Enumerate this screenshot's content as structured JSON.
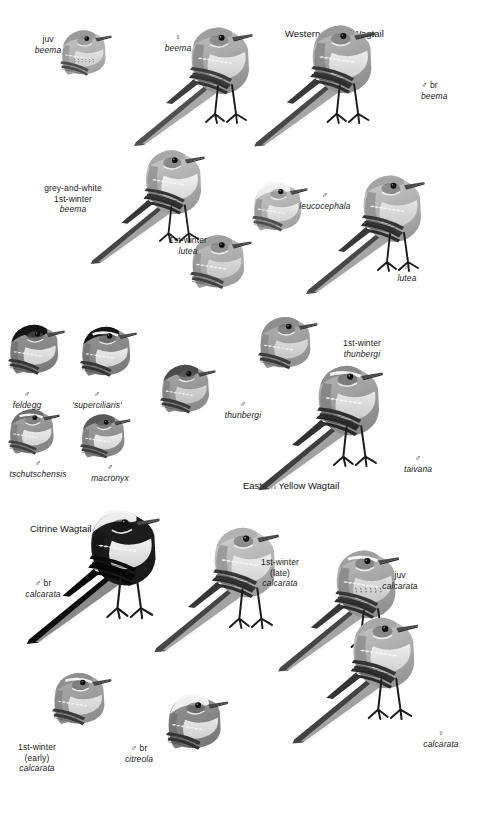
{
  "plate": {
    "kind": "bird-identification-plate",
    "background": "#ffffff",
    "ink": "#1a1a1a",
    "titles": [
      {
        "id": "western-yellow-wagtail",
        "text": "Western Yellow Wagtail",
        "x": 285,
        "y": 28
      },
      {
        "id": "eastern-yellow-wagtail",
        "text": "Eastern Yellow Wagtail",
        "x": 243,
        "y": 480
      },
      {
        "id": "citrine-wagtail",
        "text": "Citrine Wagtail",
        "x": 30,
        "y": 523
      }
    ],
    "labels": [
      {
        "id": "juv-beema",
        "align": "center",
        "x": 48,
        "y": 34,
        "lines": [
          {
            "text": "juv",
            "style": "roman"
          },
          {
            "text": "beema",
            "style": "italic"
          }
        ]
      },
      {
        "id": "female-beema",
        "align": "center",
        "x": 178,
        "y": 32,
        "lines": [
          {
            "text": "♀",
            "style": "symbol"
          },
          {
            "text": "beema",
            "style": "italic"
          }
        ]
      },
      {
        "id": "male-br-beema",
        "align": "left",
        "x": 421,
        "y": 80,
        "lines": [
          {
            "text": "♂ br",
            "style": "symbol"
          },
          {
            "text": "beema",
            "style": "italic"
          }
        ]
      },
      {
        "id": "grey-and-white-1st-winter-beema",
        "align": "center",
        "x": 73,
        "y": 183,
        "lines": [
          {
            "text": "grey-and-white",
            "style": "roman"
          },
          {
            "text": "1st-winter",
            "style": "roman"
          },
          {
            "text": "beema",
            "style": "italic"
          }
        ]
      },
      {
        "id": "male-leucocephala",
        "align": "center",
        "x": 325,
        "y": 190,
        "lines": [
          {
            "text": "♂",
            "style": "symbol"
          },
          {
            "text": "leucocephala",
            "style": "italic"
          }
        ]
      },
      {
        "id": "1st-winter-lutea",
        "align": "center",
        "x": 188,
        "y": 235,
        "lines": [
          {
            "text": "1st-winter",
            "style": "roman"
          },
          {
            "text": "lutea",
            "style": "italic"
          }
        ]
      },
      {
        "id": "male-lutea",
        "align": "center",
        "x": 407,
        "y": 262,
        "lines": [
          {
            "text": "♂",
            "style": "symbol"
          },
          {
            "text": "lutea",
            "style": "italic"
          }
        ]
      },
      {
        "id": "1st-winter-thunbergi",
        "align": "center",
        "x": 362,
        "y": 338,
        "lines": [
          {
            "text": "1st-winter",
            "style": "roman"
          },
          {
            "text": "thunbergi",
            "style": "italic"
          }
        ]
      },
      {
        "id": "male-feldegg",
        "align": "center",
        "x": 27,
        "y": 389,
        "lines": [
          {
            "text": "♂",
            "style": "symbol"
          },
          {
            "text": "feldegg",
            "style": "italic"
          }
        ]
      },
      {
        "id": "male-superciliaris",
        "align": "center",
        "x": 97,
        "y": 389,
        "lines": [
          {
            "text": "♂",
            "style": "symbol"
          },
          {
            "text": "'superciliaris'",
            "style": "italic"
          }
        ]
      },
      {
        "id": "male-thunbergi",
        "align": "center",
        "x": 243,
        "y": 399,
        "lines": [
          {
            "text": "♂",
            "style": "symbol"
          },
          {
            "text": "thunbergi",
            "style": "italic"
          }
        ]
      },
      {
        "id": "male-tschutschensis",
        "align": "center",
        "x": 38,
        "y": 458,
        "lines": [
          {
            "text": "♂",
            "style": "symbol"
          },
          {
            "text": "tschutschensis",
            "style": "italic"
          }
        ]
      },
      {
        "id": "male-macronyx",
        "align": "center",
        "x": 110,
        "y": 462,
        "lines": [
          {
            "text": "♂",
            "style": "symbol"
          },
          {
            "text": "macronyx",
            "style": "italic"
          }
        ]
      },
      {
        "id": "male-taivana",
        "align": "center",
        "x": 418,
        "y": 453,
        "lines": [
          {
            "text": "♂",
            "style": "symbol"
          },
          {
            "text": "taivana",
            "style": "italic"
          }
        ]
      },
      {
        "id": "male-br-calcarata",
        "align": "center",
        "x": 43,
        "y": 578,
        "lines": [
          {
            "text": "♂ br",
            "style": "symbol"
          },
          {
            "text": "calcarata",
            "style": "italic"
          }
        ]
      },
      {
        "id": "1st-winter-late-calcarata",
        "align": "center",
        "x": 280,
        "y": 557,
        "lines": [
          {
            "text": "1st-winter",
            "style": "roman"
          },
          {
            "text": "(late)",
            "style": "roman"
          },
          {
            "text": "calcarata",
            "style": "italic"
          }
        ]
      },
      {
        "id": "juv-calcarata",
        "align": "center",
        "x": 400,
        "y": 570,
        "lines": [
          {
            "text": "juv",
            "style": "roman"
          },
          {
            "text": "calcarata",
            "style": "italic"
          }
        ]
      },
      {
        "id": "1st-winter-early-calcarata",
        "align": "center",
        "x": 37,
        "y": 742,
        "lines": [
          {
            "text": "1st-winter",
            "style": "roman"
          },
          {
            "text": "(early)",
            "style": "roman"
          },
          {
            "text": "calcarata",
            "style": "italic"
          }
        ]
      },
      {
        "id": "male-br-citreola",
        "align": "center",
        "x": 139,
        "y": 743,
        "lines": [
          {
            "text": "♂ br",
            "style": "symbol"
          },
          {
            "text": "citreola",
            "style": "italic"
          }
        ]
      },
      {
        "id": "female-calcarata",
        "align": "center",
        "x": 441,
        "y": 728,
        "lines": [
          {
            "text": "♀",
            "style": "symbol"
          },
          {
            "text": "calcarata",
            "style": "italic"
          }
        ]
      }
    ],
    "birds": [
      {
        "id": "bird-juv-beema",
        "species": "juv beema",
        "form": "head-bust",
        "x": 60,
        "y": 26,
        "scale": 0.8,
        "flip": false,
        "crown": "#9a9a9a",
        "body": "#bdbdbd",
        "under": "#e6e6e6",
        "wing": "#8a8a8a",
        "cap": "none",
        "streaked": true
      },
      {
        "id": "bird-female-beema",
        "species": "female beema",
        "form": "full-body",
        "x": 128,
        "y": 22,
        "scale": 1.0,
        "flip": false,
        "crown": "#9d9d9d",
        "body": "#b2b2b2",
        "under": "#e9e9e9",
        "wing": "#7a7a7a",
        "cap": "grey",
        "streaked": false
      },
      {
        "id": "bird-male-br-beema",
        "species": "male breeding beema",
        "form": "full-body",
        "x": 248,
        "y": 20,
        "scale": 1.02,
        "flip": false,
        "crown": "#9a9a9a",
        "body": "#aeaeae",
        "under": "#ececec",
        "wing": "#6f6f6f",
        "cap": "grey",
        "streaked": false
      },
      {
        "id": "bird-grey-and-white-beema",
        "species": "grey-and-white 1st-winter beema",
        "form": "full-body",
        "x": 85,
        "y": 145,
        "scale": 0.96,
        "flip": false,
        "crown": "#a8a8a8",
        "body": "#bcbcbc",
        "under": "#f2f2f2",
        "wing": "#6a6a6a",
        "cap": "grey",
        "streaked": false
      },
      {
        "id": "bird-male-leucocephala",
        "species": "male leucocephala",
        "form": "head-bust",
        "x": 252,
        "y": 178,
        "scale": 0.86,
        "flip": false,
        "crown": "#efefef",
        "body": "#bdbdbd",
        "under": "#ededed",
        "wing": "#8f8f8f",
        "cap": "white",
        "streaked": false
      },
      {
        "id": "bird-male-lutea",
        "species": "male lutea",
        "form": "full-body",
        "x": 300,
        "y": 170,
        "scale": 1.0,
        "flip": false,
        "crown": "#a5a5a5",
        "body": "#bdbdbd",
        "under": "#e4e4e4",
        "wing": "#6e6e6e",
        "cap": "grey",
        "streaked": false
      },
      {
        "id": "bird-1st-winter-lutea",
        "species": "1st-winter lutea",
        "form": "head-bust",
        "x": 190,
        "y": 230,
        "scale": 0.95,
        "flip": false,
        "crown": "#9f9f9f",
        "body": "#b6b6b6",
        "under": "#dcdcdc",
        "wing": "#7d7d7d",
        "cap": "grey",
        "streaked": false
      },
      {
        "id": "bird-1st-winter-thunbergi",
        "species": "1st-winter thunbergi",
        "form": "head-bust",
        "x": 258,
        "y": 312,
        "scale": 0.92,
        "flip": false,
        "crown": "#8e8e8e",
        "body": "#a9a9a9",
        "under": "#dedede",
        "wing": "#6d6d6d",
        "cap": "grey",
        "streaked": false
      },
      {
        "id": "bird-male-feldegg",
        "species": "male feldegg",
        "form": "head-bust",
        "x": 8,
        "y": 320,
        "scale": 0.88,
        "flip": false,
        "crown": "#141414",
        "body": "#8f8f8f",
        "under": "#ececec",
        "wing": "#5f5f5f",
        "cap": "black",
        "streaked": false
      },
      {
        "id": "bird-male-superciliaris",
        "species": "male superciliaris",
        "form": "head-bust",
        "x": 80,
        "y": 322,
        "scale": 0.88,
        "flip": false,
        "crown": "#141414",
        "body": "#8f8f8f",
        "under": "#efefef",
        "wing": "#5f5f5f",
        "cap": "black-brow",
        "streaked": false
      },
      {
        "id": "bird-male-thunbergi",
        "species": "male thunbergi",
        "form": "head-bust",
        "x": 160,
        "y": 360,
        "scale": 0.86,
        "flip": false,
        "crown": "#4c4c4c",
        "body": "#a0a0a0",
        "under": "#d8d8d8",
        "wing": "#6a6a6a",
        "cap": "dark",
        "streaked": false
      },
      {
        "id": "bird-male-tschutschensis",
        "species": "male tschutschensis",
        "form": "head-bust",
        "x": 8,
        "y": 405,
        "scale": 0.8,
        "flip": false,
        "crown": "#6e6e6e",
        "body": "#9c9c9c",
        "under": "#f0f0f0",
        "wing": "#7a7a7a",
        "cap": "brow",
        "streaked": false
      },
      {
        "id": "bird-male-macronyx",
        "species": "male macronyx",
        "form": "head-bust",
        "x": 80,
        "y": 410,
        "scale": 0.78,
        "flip": false,
        "crown": "#5a5a5a",
        "body": "#9a9a9a",
        "under": "#f2f2f2",
        "wing": "#757575",
        "cap": "dark",
        "streaked": false
      },
      {
        "id": "bird-male-taivana",
        "species": "male taivana",
        "form": "full-body",
        "x": 252,
        "y": 360,
        "scale": 1.05,
        "flip": false,
        "crown": "#8c8c8c",
        "body": "#a8a8a8",
        "under": "#e7e7e7",
        "wing": "#5f5f5f",
        "cap": "brow",
        "streaked": false
      },
      {
        "id": "bird-male-br-calcarata",
        "species": "male breeding calcarata",
        "form": "full-body",
        "x": 20,
        "y": 505,
        "scale": 1.12,
        "flip": false,
        "crown": "#ededed",
        "body": "#1e1e1e",
        "under": "#f0f0f0",
        "wing": "#141414",
        "cap": "white",
        "streaked": false
      },
      {
        "id": "bird-1st-winter-late-calcarata",
        "species": "1st-winter late calcarata",
        "form": "full-body",
        "x": 148,
        "y": 522,
        "scale": 1.05,
        "flip": false,
        "crown": "#b2b2b2",
        "body": "#c2c2c2",
        "under": "#ededed",
        "wing": "#6a6a6a",
        "cap": "grey",
        "streaked": false
      },
      {
        "id": "bird-juv-calcarata",
        "species": "juv calcarata",
        "form": "full-body",
        "x": 272,
        "y": 545,
        "scale": 1.02,
        "flip": false,
        "crown": "#a0a0a0",
        "body": "#b0b0b0",
        "under": "#e0e0e0",
        "wing": "#6b6b6b",
        "cap": "brow",
        "streaked": true
      },
      {
        "id": "bird-1st-winter-early-calcarata",
        "species": "1st-winter early calcarata",
        "form": "head-bust",
        "x": 52,
        "y": 668,
        "scale": 0.92,
        "flip": false,
        "crown": "#8f8f8f",
        "body": "#a5a5a5",
        "under": "#e8e8e8",
        "wing": "#6a6a6a",
        "cap": "brow",
        "streaked": false
      },
      {
        "id": "bird-male-br-citreola",
        "species": "male breeding citreola",
        "form": "head-bust",
        "x": 166,
        "y": 690,
        "scale": 0.96,
        "flip": false,
        "crown": "#f0f0f0",
        "body": "#8d8d8d",
        "under": "#ececec",
        "wing": "#5a5a5a",
        "cap": "white",
        "streaked": false
      },
      {
        "id": "bird-female-calcarata",
        "species": "female calcarata",
        "form": "full-body",
        "x": 286,
        "y": 612,
        "scale": 1.06,
        "flip": false,
        "crown": "#a8a8a8",
        "body": "#b8b8b8",
        "under": "#ededed",
        "wing": "#666666",
        "cap": "grey",
        "streaked": false
      }
    ]
  }
}
